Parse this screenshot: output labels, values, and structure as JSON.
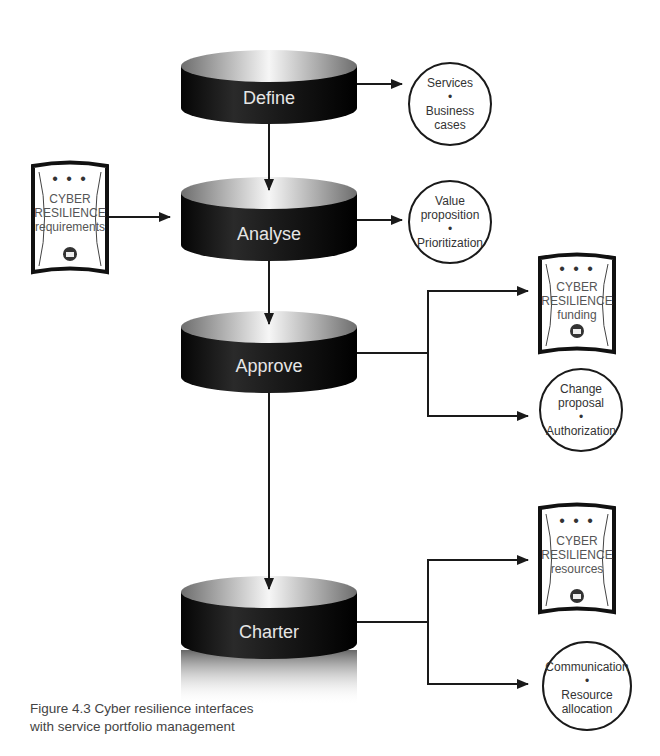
{
  "header_fragment": "…ng structure",
  "stages": [
    {
      "id": "define",
      "label": "Define"
    },
    {
      "id": "analyse",
      "label": "Analyse"
    },
    {
      "id": "approve",
      "label": "Approve"
    },
    {
      "id": "charter",
      "label": "Charter"
    }
  ],
  "outputs": {
    "define": {
      "line1": "Services",
      "bullet": "•",
      "line2": "Business",
      "line3": "cases"
    },
    "analyse": {
      "line1": "Value",
      "line2": "proposition",
      "bullet": "•",
      "line3": "Prioritization"
    },
    "approve_circle": {
      "line1": "Change",
      "line2": "proposal",
      "bullet": "•",
      "line3": "Authorization"
    },
    "charter_circle": {
      "line1": "Communication",
      "bullet": "•",
      "line2": "Resource",
      "line3": "allocation"
    }
  },
  "documents": {
    "requirements": {
      "dots": "• • •",
      "line1": "CYBER",
      "line2": "RESILIENCE",
      "line3": "requirements"
    },
    "funding": {
      "dots": "• • •",
      "line1": "CYBER",
      "line2": "RESILIENCE",
      "line3": "funding"
    },
    "resources": {
      "dots": "• • •",
      "line1": "CYBER",
      "line2": "RESILIENCE",
      "line3": "resources"
    }
  },
  "caption": {
    "line1": "Figure 4.3  Cyber resilience interfaces",
    "line2": "with service portfolio management"
  },
  "colors": {
    "cylinder_body": "#111111",
    "cylinder_top_light": "#f4f4f4",
    "cylinder_top_dark": "#6e6e6e",
    "stroke": "#1a1a1a",
    "label_text": "#e6e6e6"
  }
}
